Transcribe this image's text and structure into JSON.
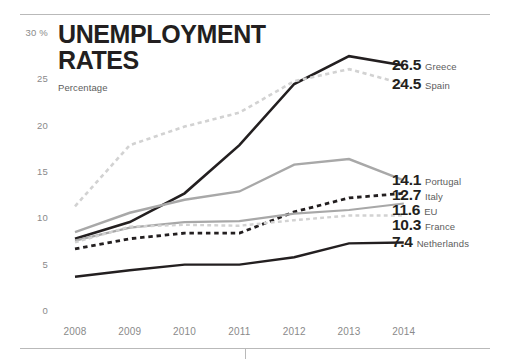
{
  "header": {
    "title": "UNEMPLOYMENT\nRATES",
    "subtitle": "Percentage"
  },
  "axis": {
    "y_unit_label": "30 %",
    "y_ticks": [
      "30 %",
      "25",
      "20",
      "15",
      "10",
      "5",
      "0"
    ],
    "x_ticks": [
      "2008",
      "2009",
      "2010",
      "2011",
      "2012",
      "2013",
      "2014"
    ]
  },
  "end_labels": [
    {
      "value": "26.5",
      "name": "Greece"
    },
    {
      "value": "24.5",
      "name": "Spain"
    },
    {
      "value": "14.1",
      "name": "Portugal"
    },
    {
      "value": "12.7",
      "name": "Italy"
    },
    {
      "value": "11.6",
      "name": "EU"
    },
    {
      "value": "10.3",
      "name": "France"
    },
    {
      "value": "7.4",
      "name": "Netherlands"
    }
  ],
  "colors": {
    "dark": "#231f20",
    "mid_gray": "#a8a8a8",
    "light_gray": "#d2d2d2",
    "tick_text": "#8a8a8a",
    "rule": "#b9b9b9"
  },
  "chart_data": {
    "type": "line",
    "title": "UNEMPLOYMENT RATES",
    "subtitle": "Percentage",
    "xlabel": "",
    "ylabel": "Percentage",
    "ylim": [
      0,
      30
    ],
    "yticks": [
      0,
      5,
      10,
      15,
      20,
      25,
      30
    ],
    "grid": false,
    "legend": "right-end-labels",
    "x": [
      2008,
      2009,
      2010,
      2011,
      2012,
      2013,
      2014
    ],
    "series": [
      {
        "name": "Greece",
        "values": [
          7.8,
          9.6,
          12.7,
          17.9,
          24.5,
          27.5,
          26.5
        ],
        "color": "#231f20",
        "style": "solid",
        "width": 2.6,
        "end_value": "26.5"
      },
      {
        "name": "Spain",
        "values": [
          11.3,
          17.9,
          19.9,
          21.4,
          24.8,
          26.1,
          24.5
        ],
        "color": "#d2d2d2",
        "style": "dashed",
        "width": 2.6,
        "end_value": "24.5"
      },
      {
        "name": "Portugal",
        "values": [
          8.5,
          10.6,
          12.0,
          12.9,
          15.8,
          16.4,
          14.1
        ],
        "color": "#a8a8a8",
        "style": "solid",
        "width": 2.4,
        "end_value": "14.1"
      },
      {
        "name": "Italy",
        "values": [
          6.7,
          7.8,
          8.4,
          8.4,
          10.7,
          12.2,
          12.7
        ],
        "color": "#231f20",
        "style": "dashed",
        "width": 2.8,
        "end_value": "12.7"
      },
      {
        "name": "EU",
        "values": [
          7.6,
          9.0,
          9.6,
          9.7,
          10.5,
          10.9,
          11.6
        ],
        "color": "#a8a8a8",
        "style": "solid",
        "width": 2.2,
        "end_value": "11.6"
      },
      {
        "name": "France",
        "values": [
          7.4,
          9.1,
          9.3,
          9.2,
          9.8,
          10.3,
          10.3
        ],
        "color": "#d2d2d2",
        "style": "dashed",
        "width": 2.4,
        "end_value": "10.3"
      },
      {
        "name": "Netherlands",
        "values": [
          3.7,
          4.4,
          5.0,
          5.0,
          5.8,
          7.3,
          7.4
        ],
        "color": "#231f20",
        "style": "solid",
        "width": 2.4,
        "end_value": "7.4"
      }
    ]
  }
}
